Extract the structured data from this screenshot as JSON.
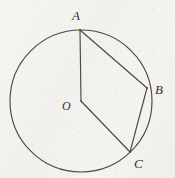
{
  "figure": {
    "kind": "circle-geometry-diagram",
    "canvas": {
      "width": 175,
      "height": 178
    },
    "colors": {
      "background": "#f3f2ee",
      "stroke": "#4a4846",
      "label": "#33312f"
    },
    "circle": {
      "name": "main-circle",
      "center_x": 81,
      "center_y": 101,
      "radius": 71,
      "stroke_width": 1.1
    },
    "points": [
      {
        "id": "A",
        "label": "A",
        "x": 80,
        "y": 30,
        "label_x": 72,
        "label_y": 9
      },
      {
        "id": "B",
        "label": "B",
        "x": 147,
        "y": 88,
        "label_x": 155,
        "label_y": 83
      },
      {
        "id": "C",
        "label": "C",
        "x": 130,
        "y": 152,
        "label_x": 134,
        "label_y": 157
      },
      {
        "id": "O",
        "label": "O",
        "x": 81,
        "y": 101,
        "label_x": 62,
        "label_y": 100
      }
    ],
    "segments": [
      {
        "id": "OA",
        "from": "O",
        "to": "A",
        "type": "radius",
        "x1": 81,
        "y1": 101,
        "x2": 80,
        "y2": 30
      },
      {
        "id": "AB",
        "from": "A",
        "to": "B",
        "type": "chord",
        "x1": 80,
        "y1": 30,
        "x2": 147,
        "y2": 88
      },
      {
        "id": "OC",
        "from": "O",
        "to": "C",
        "type": "radius",
        "x1": 81,
        "y1": 101,
        "x2": 130,
        "y2": 152
      },
      {
        "id": "BC",
        "from": "B",
        "to": "C",
        "type": "chord",
        "x1": 147,
        "y1": 88,
        "x2": 130,
        "y2": 152
      }
    ],
    "labels": {
      "A": "A",
      "B": "B",
      "C": "C",
      "O": "O"
    }
  }
}
